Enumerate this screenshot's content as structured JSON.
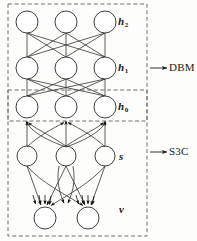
{
  "figure": {
    "type": "diagram",
    "background_color": "#fdfdfb",
    "stroke_color": "#2b2b2b",
    "dashed_box_color": "#6e6e6e"
  },
  "layer_labels": [
    {
      "id": "h2",
      "base": "h",
      "sub": "2",
      "x": 118,
      "y": 22
    },
    {
      "id": "h1",
      "base": "h",
      "sub": "1",
      "x": 118,
      "y": 63
    },
    {
      "id": "h0",
      "base": "h",
      "sub": "0",
      "x": 118,
      "y": 102
    },
    {
      "id": "s",
      "base": "s",
      "sub": "",
      "x": 118,
      "y": 150
    },
    {
      "id": "v",
      "base": "v",
      "sub": "",
      "x": 118,
      "y": 205
    }
  ],
  "model_labels": [
    {
      "id": "dbm",
      "text": "DBM",
      "x": 174,
      "y": 63
    },
    {
      "id": "s3c",
      "text": "S3C",
      "x": 174,
      "y": 147
    }
  ],
  "grouping_boxes": [
    {
      "id": "dbm-box",
      "label": "DBM",
      "x": 8,
      "y": 4,
      "width": 139,
      "height": 117
    },
    {
      "id": "s3c-box",
      "label": "S3C",
      "x": 8,
      "y": 90,
      "width": 139,
      "height": 146
    }
  ],
  "callout_arrows": [
    {
      "id": "dbm-arrow",
      "from_x": 150,
      "to_x": 168,
      "y": 68
    },
    {
      "id": "s3c-arrow",
      "from_x": 150,
      "to_x": 168,
      "y": 152
    }
  ],
  "nodes": {
    "h2": [
      {
        "cx": 27,
        "cy": 22,
        "r": 11
      },
      {
        "cx": 66,
        "cy": 22,
        "r": 11
      },
      {
        "cx": 105,
        "cy": 22,
        "r": 11
      }
    ],
    "h1": [
      {
        "cx": 27,
        "cy": 68,
        "r": 11
      },
      {
        "cx": 66,
        "cy": 68,
        "r": 11
      },
      {
        "cx": 105,
        "cy": 68,
        "r": 11
      }
    ],
    "h0": [
      {
        "cx": 27,
        "cy": 107,
        "r": 11
      },
      {
        "cx": 66,
        "cy": 107,
        "r": 11
      },
      {
        "cx": 105,
        "cy": 107,
        "r": 11
      }
    ],
    "s": [
      {
        "cx": 27,
        "cy": 156,
        "r": 10
      },
      {
        "cx": 66,
        "cy": 156,
        "r": 10
      },
      {
        "cx": 105,
        "cy": 156,
        "r": 10
      }
    ],
    "v": [
      {
        "cx": 45,
        "cy": 218,
        "r": 11
      },
      {
        "cx": 88,
        "cy": 218,
        "r": 11
      }
    ]
  },
  "edges": {
    "h2_h1": {
      "style": "undirected",
      "pattern": "fully-connected",
      "count": 9
    },
    "h1_h0": {
      "style": "undirected",
      "pattern": "fully-connected",
      "count": 9
    },
    "s_h0": {
      "style": "directed-up",
      "pattern": "fully-connected",
      "count": 9
    },
    "s_v": {
      "style": "directed-down",
      "pattern": "fully-connected",
      "count": 6
    }
  }
}
